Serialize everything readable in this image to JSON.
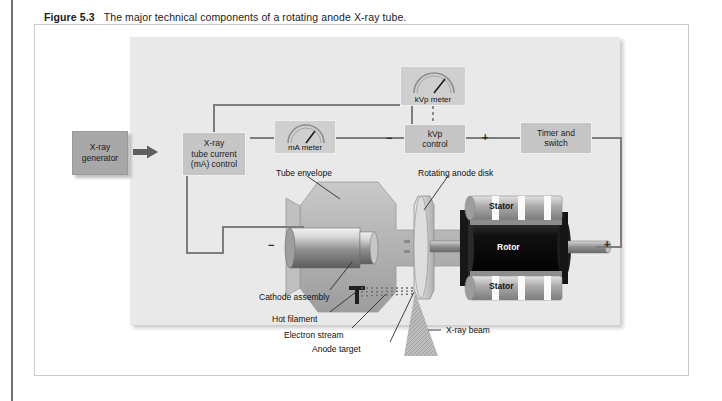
{
  "caption": {
    "figure_number": "Figure 5.3",
    "text": "The major technical components of a rotating anode X-ray tube."
  },
  "diagram": {
    "title": "rotating anode X-ray tube",
    "generator": {
      "line1": "X-ray",
      "line2": "generator"
    },
    "controls": {
      "ma_control": {
        "line1": "X-ray",
        "line2": "tube current",
        "line3": "(mA) control"
      },
      "kvp_control": {
        "line1": "kVp",
        "line2": "control"
      },
      "timer": {
        "line1": "Timer and",
        "line2": "switch"
      }
    },
    "meters": {
      "ma_meter": {
        "label": "mA meter"
      },
      "kvp_meter": {
        "label": "kVp meter"
      }
    },
    "polarity": {
      "cathode_sign": "−",
      "kvp_left_sign": "−",
      "kvp_right_sign": "+",
      "anode_sign": "+"
    },
    "component_labels": {
      "tube_envelope": "Tube envelope",
      "rotating_anode_disk": "Rotating anode disk",
      "stator_top": "Stator",
      "stator_bottom": "Stator",
      "rotor": "Rotor",
      "cathode_assembly": "Cathode assembly",
      "hot_filament": "Hot filament",
      "electron_stream": "Electron stream",
      "anode_target": "Anode target",
      "xray_beam": "X-ray beam"
    },
    "colors": {
      "panel_background": "#e9e9e9",
      "control_box": "#c6c6c6",
      "generator_box": "#a8a8a8",
      "wire": "#7d7d7d",
      "rotor": "#121212",
      "envelope": "#b6b6b6",
      "page_background": "#ffffff"
    }
  }
}
